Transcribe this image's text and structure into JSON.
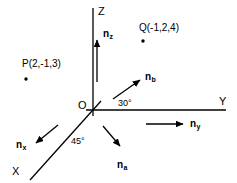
{
  "figure": {
    "type": "3d-coordinate-axes-diagram",
    "background_color": "#ffffff",
    "stroke_color": "#000000",
    "width": 237,
    "height": 183
  },
  "axes": {
    "x": {
      "label": "X",
      "label_x": 12,
      "label_y": 166
    },
    "y": {
      "label": "Y",
      "label_x": 219,
      "label_y": 96
    },
    "z": {
      "label": "Z",
      "label_x": 98,
      "label_y": 6
    }
  },
  "origin": {
    "label": "O",
    "label_x": 78,
    "label_y": 100
  },
  "points": [
    {
      "name": "point-p",
      "label": "P(2,-1,3)",
      "label_x": 22,
      "label_y": 59,
      "dot_x": 26,
      "dot_y": 79,
      "coords": [
        2,
        -1,
        3
      ]
    },
    {
      "name": "point-q",
      "label": "Q(-1,2,4)",
      "label_x": 139,
      "label_y": 23,
      "dot_x": 143,
      "dot_y": 41,
      "coords": [
        -1,
        2,
        4
      ]
    }
  ],
  "vectors": [
    {
      "name": "vector-nz",
      "base": "n",
      "sub": "z",
      "label_x": 103,
      "label_y": 29,
      "direction": "up"
    },
    {
      "name": "vector-nb",
      "base": "n",
      "sub": "b",
      "label_x": 145,
      "label_y": 72,
      "direction": "up-right-30deg"
    },
    {
      "name": "vector-ny",
      "base": "n",
      "sub": "y",
      "label_x": 190,
      "label_y": 119,
      "direction": "right"
    },
    {
      "name": "vector-na",
      "base": "n",
      "sub": "a",
      "label_x": 117,
      "label_y": 160,
      "direction": "down-right"
    },
    {
      "name": "vector-nx",
      "base": "n",
      "sub": "x",
      "label_x": 16,
      "label_y": 140,
      "direction": "down-left-45deg"
    }
  ],
  "angles": [
    {
      "name": "angle-30",
      "label": "30°",
      "label_x": 118,
      "label_y": 99
    },
    {
      "name": "angle-45",
      "label": "45°",
      "label_x": 71,
      "label_y": 137
    }
  ]
}
